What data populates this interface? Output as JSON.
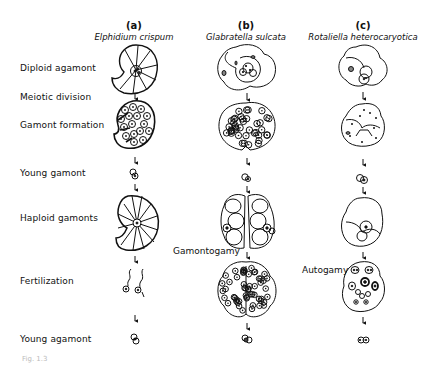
{
  "columns": [
    {
      "letter": "(a)",
      "species": "Elphidium crispum"
    },
    {
      "letter": "(b)",
      "species": "Glabratella sulcata"
    },
    {
      "letter": "(c)",
      "species": "Rotaliella heterocaryotica"
    }
  ],
  "rows": [
    {
      "label": "Diploid agamont"
    },
    {
      "label": "Meiotic division"
    },
    {
      "label": "Gamont formation"
    },
    {
      "label": "Young gamont"
    },
    {
      "label": "Haploid gamonts"
    },
    {
      "label": "Fertilization"
    },
    {
      "label": "Young agamont"
    }
  ],
  "annotations": {
    "gamontogamy": "Gamontogamy",
    "autogamy": "Autogamy"
  },
  "caption": "Fig. 1.3"
}
